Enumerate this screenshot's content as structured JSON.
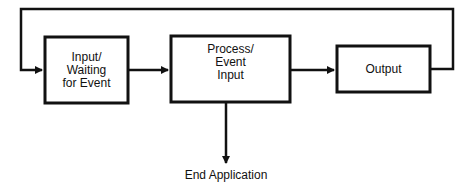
{
  "diagram": {
    "type": "flowchart",
    "colors": {
      "stroke": "#111111",
      "background": "#ffffff",
      "text": "#111111"
    },
    "nodes": [
      {
        "id": "input",
        "label_lines": [
          "Input/",
          "Waiting",
          "for Event"
        ]
      },
      {
        "id": "process",
        "label_lines": [
          "Process/",
          "Event",
          "Input"
        ]
      },
      {
        "id": "output",
        "label_lines": [
          "Output"
        ]
      },
      {
        "id": "end",
        "label_lines": [
          "End Application"
        ]
      }
    ],
    "edges": [
      {
        "from": "input",
        "to": "process"
      },
      {
        "from": "process",
        "to": "output"
      },
      {
        "from": "output",
        "to": "input",
        "route": "loop-over-top"
      },
      {
        "from": "process",
        "to": "end"
      }
    ]
  }
}
